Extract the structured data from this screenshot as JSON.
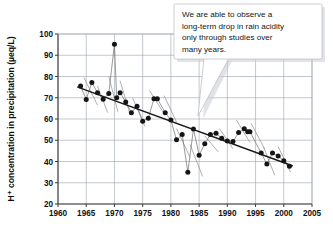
{
  "figure": {
    "title_visible": false,
    "background_color": "#ffffff"
  },
  "callout": {
    "name": "annotation-callout",
    "lines": [
      "We are able to observe a",
      "long-term drop in rain acidity",
      "only through studies over",
      "many years."
    ],
    "text": "We are able to observe a long-term drop in rain acidity only through studies over many years.",
    "background_color": "#ffffff",
    "border_color": "#b6bac0",
    "shadow_color": "#c9ccd1",
    "tail_target": "trend-line near 1988"
  },
  "chart_data": {
    "type": "scatter",
    "title": "",
    "xlabel": "",
    "ylabel": "H⁺ concentration in precipitation (µeq/L)",
    "xlim": [
      1960,
      2005
    ],
    "ylim": [
      20,
      100
    ],
    "xticks": [
      1960,
      1965,
      1970,
      1975,
      1980,
      1985,
      1990,
      1995,
      2000,
      2005
    ],
    "yticks": [
      20,
      30,
      40,
      50,
      60,
      70,
      80,
      90,
      100
    ],
    "xtick_labels": [
      "1960",
      "1965",
      "1970",
      "1975",
      "1980",
      "1985",
      "1990",
      "1995",
      "2000",
      "2005"
    ],
    "ytick_labels": [
      "20",
      "30",
      "40",
      "50",
      "60",
      "70",
      "80",
      "90",
      "100"
    ],
    "grid": true,
    "legend": null,
    "point_color": "#151515",
    "line_color": "#6e6e6e",
    "trend_color": "#1b1b1b",
    "series": [
      {
        "name": "H+ concentration in precipitation",
        "x": [
          1964,
          1965,
          1966,
          1967,
          1968,
          1969,
          1970,
          1970.4,
          1971,
          1972,
          1973,
          1974,
          1975,
          1976,
          1977,
          1977.6,
          1979,
          1980,
          1981,
          1982,
          1983,
          1984,
          1985,
          1986,
          1987,
          1988,
          1989,
          1990,
          1991,
          1992,
          1993,
          1993.6,
          1994,
          1996,
          1997,
          1998,
          1999,
          2000,
          2001
        ],
        "y": [
          75.5,
          69.2,
          77.2,
          72.4,
          69.3,
          72.0,
          95.2,
          70.0,
          72.4,
          68.0,
          63.0,
          66.0,
          59.0,
          60.4,
          69.5,
          69.5,
          63.0,
          59.5,
          50.2,
          52.7,
          35.0,
          55.3,
          43.0,
          48.3,
          52.7,
          53.3,
          51.0,
          49.7,
          49.4,
          53.6,
          55.4,
          54.0,
          54.0,
          44.0,
          38.8,
          44.0,
          42.6,
          40.4,
          37.8
        ]
      }
    ],
    "trend": {
      "name": "long-term linear trend",
      "x": [
        1963.5,
        2001.5
      ],
      "y": [
        75.0,
        38.0
      ]
    },
    "short_segments": [
      {
        "x": [
          1964.6,
          1967.0
        ],
        "y": [
          79.5,
          66.5
        ]
      },
      {
        "x": [
          1967.0,
          1968.8
        ],
        "y": [
          75.5,
          63.0
        ]
      },
      {
        "x": [
          1969.0,
          1970.6
        ],
        "y": [
          80.0,
          63.5
        ]
      },
      {
        "x": [
          1971.0,
          1972.8
        ],
        "y": [
          78.0,
          62.0
        ]
      },
      {
        "x": [
          1973.2,
          1975.4
        ],
        "y": [
          70.0,
          56.5
        ]
      },
      {
        "x": [
          1976.2,
          1978.8
        ],
        "y": [
          73.5,
          62.5
        ]
      },
      {
        "x": [
          1978.8,
          1981.0
        ],
        "y": [
          71.0,
          58.5
        ]
      },
      {
        "x": [
          1981.0,
          1983.4
        ],
        "y": [
          55.5,
          42.0
        ]
      },
      {
        "x": [
          1983.4,
          1985.6
        ],
        "y": [
          48.0,
          33.0
        ]
      },
      {
        "x": [
          1986.0,
          1988.4
        ],
        "y": [
          52.0,
          44.5
        ]
      },
      {
        "x": [
          1988.6,
          1991.0
        ],
        "y": [
          55.5,
          46.0
        ]
      },
      {
        "x": [
          1991.6,
          1994.0
        ],
        "y": [
          59.5,
          49.0
        ]
      },
      {
        "x": [
          1994.2,
          1996.6
        ],
        "y": [
          58.0,
          46.0
        ]
      },
      {
        "x": [
          1996.4,
          1998.4
        ],
        "y": [
          47.0,
          33.5
        ]
      },
      {
        "x": [
          1999.0,
          2001.2
        ],
        "y": [
          47.0,
          35.0
        ]
      }
    ]
  }
}
